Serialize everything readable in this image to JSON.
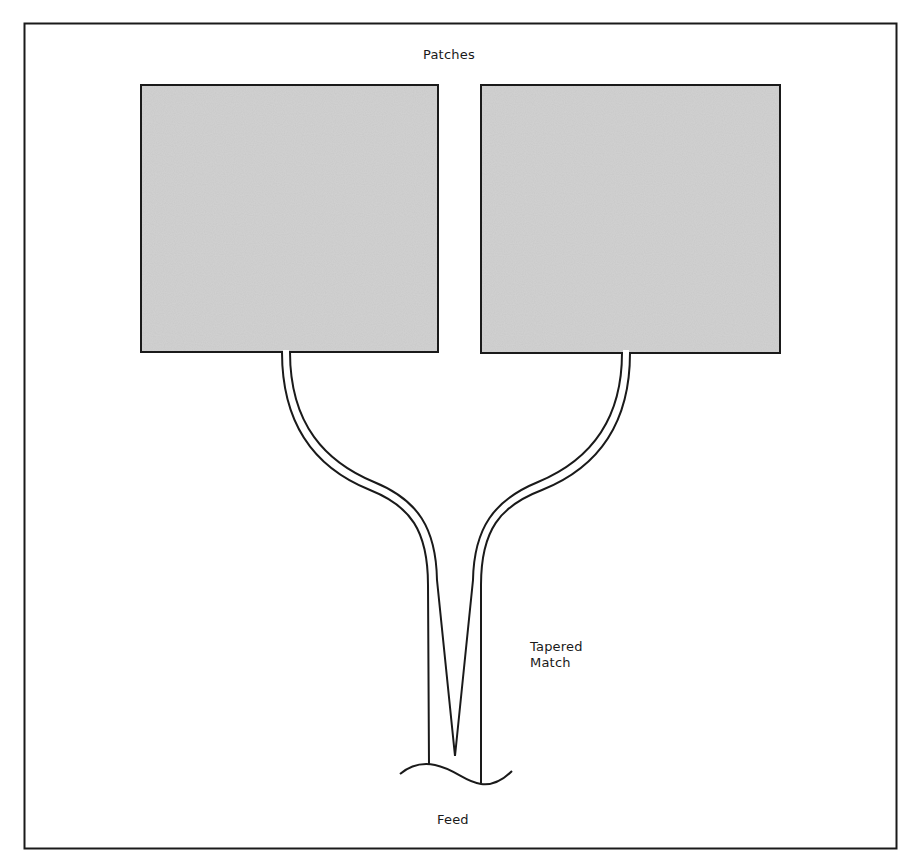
{
  "diagram": {
    "type": "antenna-array-schematic",
    "labels": {
      "patches": "Patches",
      "tapered_match_line1": "Tapered",
      "tapered_match_line2": "Match",
      "feed": "Feed"
    },
    "elements": [
      {
        "id": "patch-left",
        "kind": "rectangle",
        "fill": "stippled-gray"
      },
      {
        "id": "patch-right",
        "kind": "rectangle",
        "fill": "stippled-gray"
      },
      {
        "id": "feed-line-left",
        "kind": "curved-microstrip",
        "connects": [
          "patch-left",
          "tapered-match"
        ]
      },
      {
        "id": "feed-line-right",
        "kind": "curved-microstrip",
        "connects": [
          "patch-right",
          "tapered-match"
        ]
      },
      {
        "id": "tapered-match",
        "kind": "v-taper",
        "connects": [
          "feed"
        ]
      },
      {
        "id": "feed",
        "kind": "break-line"
      }
    ],
    "colors": {
      "border": "#1a1a1a",
      "patch_fill": "#c6c6c6",
      "background": "#ffffff",
      "line": "#1a1a1a"
    }
  }
}
